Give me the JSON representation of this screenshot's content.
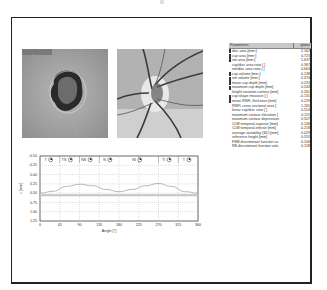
{
  "images": {
    "left": {
      "label": "topography-image"
    },
    "right": {
      "label": "reflectance-image"
    }
  },
  "parameters": {
    "header": {
      "name": "Parameters",
      "value": "global"
    },
    "rows": [
      {
        "name": "disc area [mm²]",
        "value": "2.162",
        "swatch": true
      },
      {
        "name": "cup area [mm²]",
        "value": "0.725",
        "swatch": true
      },
      {
        "name": "rim area [mm²]",
        "value": "1.637",
        "swatch": true
      },
      {
        "name": "cup/disc area ratio [ ]",
        "value": "0.367",
        "swatch": false
      },
      {
        "name": "rim/disc area ratio [ ]",
        "value": "0.663",
        "swatch": false
      },
      {
        "name": "cup volume [mm³]",
        "value": "0.138",
        "swatch": true
      },
      {
        "name": "rim volume [mm³]",
        "value": "0.374",
        "swatch": true
      },
      {
        "name": "mean cup depth [mm]",
        "value": "0.220",
        "swatch": true
      },
      {
        "name": "maximum cup depth [mm]",
        "value": "0.543",
        "swatch": true
      },
      {
        "name": "height variation contour [mm]",
        "value": "0.261",
        "swatch": false
      },
      {
        "name": "cup shape measure [ ]",
        "value": "-0.131",
        "swatch": true
      },
      {
        "name": "mean RNFL thickness [mm]",
        "value": "0.229",
        "swatch": true
      },
      {
        "name": "RNFL cross sectional area [",
        "value": "1.265",
        "swatch": false
      },
      {
        "name": "linear cup/disc ratio [ ]",
        "value": "0.554",
        "swatch": false
      },
      {
        "name": "maximum contour elevation [",
        "value": "0.115",
        "swatch": false
      },
      {
        "name": "maximum contour depression",
        "value": "0.507",
        "swatch": false
      },
      {
        "name": "CLM temporal-superior [mm]",
        "value": "0.146",
        "swatch": false
      },
      {
        "name": "CLM temporal-inferior [mm]",
        "value": "0.218",
        "swatch": false
      },
      {
        "name": "average variability (SD) [mm]",
        "value": "0.029",
        "swatch": false
      },
      {
        "name": "reference height [mm]",
        "value": "0.555",
        "swatch": false
      },
      {
        "name": "FSM discriminant function va",
        "value": "0.106",
        "swatch": false
      },
      {
        "name": "RB discriminant function valu",
        "value": "0.158",
        "swatch": false
      }
    ]
  },
  "chart_data": {
    "type": "line",
    "title": "",
    "xlabel": "Angle [°]",
    "ylabel": "z [mm]",
    "xlim": [
      0,
      360
    ],
    "ylim": [
      1.25,
      -0.5
    ],
    "y_inverted": true,
    "xticks": [
      0,
      45,
      90,
      135,
      180,
      225,
      270,
      315,
      360
    ],
    "yticks": [
      "-0.50",
      "-0.25",
      "0.00",
      "0.25",
      "0.50",
      "0.75",
      "1.00",
      "1.25"
    ],
    "grid": true,
    "sector_labels": [
      "T",
      "TS",
      "NS",
      "N",
      "NI",
      "TI",
      "T"
    ],
    "series": [
      {
        "name": "contour height profile",
        "x": [
          0,
          30,
          60,
          90,
          120,
          150,
          180,
          210,
          240,
          270,
          300,
          330,
          360
        ],
        "values": [
          0.5,
          0.45,
          0.32,
          0.26,
          0.3,
          0.4,
          0.46,
          0.4,
          0.3,
          0.24,
          0.32,
          0.46,
          0.5
        ]
      },
      {
        "name": "reference height",
        "x": [
          0,
          360
        ],
        "values": [
          0.555,
          0.555
        ]
      }
    ]
  }
}
